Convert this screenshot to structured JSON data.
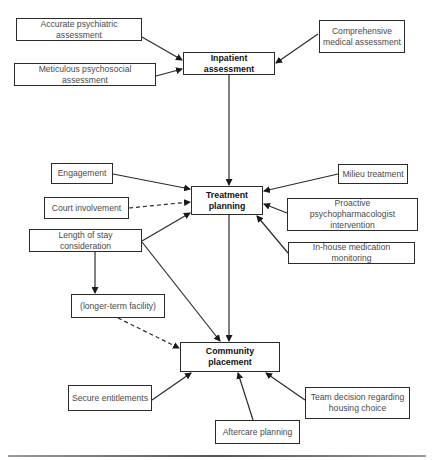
{
  "diagram": {
    "type": "flowchart",
    "nodes": [
      {
        "id": "accurate_psych",
        "label": "Accurate psychiatric assessment",
        "main": false,
        "x": 16,
        "y": 18,
        "w": 126,
        "h": 23
      },
      {
        "id": "meticulous_psychosocial",
        "label": "Meticulous psychosocial assessment",
        "main": false,
        "x": 14,
        "y": 63,
        "w": 142,
        "h": 23
      },
      {
        "id": "comprehensive_medical",
        "label": "Comprehensive medical assessment",
        "main": false,
        "x": 319,
        "y": 20,
        "w": 86,
        "h": 33
      },
      {
        "id": "inpatient",
        "label": "Inpatient assessment",
        "main": true,
        "x": 183,
        "y": 52,
        "w": 92,
        "h": 23
      },
      {
        "id": "engagement",
        "label": "Engagement",
        "main": false,
        "x": 51,
        "y": 163,
        "w": 62,
        "h": 21
      },
      {
        "id": "court",
        "label": "Court involvement",
        "main": false,
        "x": 44,
        "y": 197,
        "w": 85,
        "h": 22
      },
      {
        "id": "length_of_stay",
        "label": "Length of stay consideration",
        "main": false,
        "x": 29,
        "y": 229,
        "w": 113,
        "h": 23
      },
      {
        "id": "treatment",
        "label": "Treatment planning",
        "main": true,
        "x": 191,
        "y": 186,
        "w": 72,
        "h": 29
      },
      {
        "id": "milieu",
        "label": "Milieu treatment",
        "main": false,
        "x": 338,
        "y": 164,
        "w": 70,
        "h": 20
      },
      {
        "id": "proactive",
        "label": "Proactive psychopharmacologist intervention",
        "main": false,
        "x": 287,
        "y": 198,
        "w": 131,
        "h": 33
      },
      {
        "id": "inhouse",
        "label": "In-house medication monitoring",
        "main": false,
        "x": 288,
        "y": 242,
        "w": 127,
        "h": 22
      },
      {
        "id": "longer_term",
        "label": "(longer-term facility)",
        "main": false,
        "x": 71,
        "y": 294,
        "w": 94,
        "h": 24
      },
      {
        "id": "community",
        "label": "Community placement",
        "main": true,
        "x": 180,
        "y": 342,
        "w": 100,
        "h": 30
      },
      {
        "id": "secure",
        "label": "Secure entitlements",
        "main": false,
        "x": 68,
        "y": 385,
        "w": 84,
        "h": 26
      },
      {
        "id": "team",
        "label": "Team decision regarding housing choice",
        "main": false,
        "x": 305,
        "y": 387,
        "w": 105,
        "h": 32
      },
      {
        "id": "aftercare",
        "label": "Aftercare planning",
        "main": false,
        "x": 215,
        "y": 420,
        "w": 85,
        "h": 24
      }
    ],
    "edges": [
      {
        "from": "accurate_psych",
        "to": "inpatient",
        "style": "solid",
        "x1": 142,
        "y1": 37,
        "x2": 182,
        "y2": 60
      },
      {
        "from": "meticulous_psychosocial",
        "to": "inpatient",
        "style": "solid",
        "x1": 156,
        "y1": 76,
        "x2": 182,
        "y2": 69
      },
      {
        "from": "comprehensive_medical",
        "to": "inpatient",
        "style": "solid",
        "x1": 318,
        "y1": 34,
        "x2": 276,
        "y2": 63
      },
      {
        "from": "inpatient",
        "to": "treatment",
        "style": "solid",
        "x1": 229,
        "y1": 75,
        "x2": 229,
        "y2": 185
      },
      {
        "from": "engagement",
        "to": "treatment",
        "style": "solid",
        "x1": 113,
        "y1": 174,
        "x2": 190,
        "y2": 189
      },
      {
        "from": "court",
        "to": "treatment",
        "style": "dashed",
        "x1": 129,
        "y1": 208,
        "x2": 190,
        "y2": 202
      },
      {
        "from": "length_of_stay",
        "to": "treatment",
        "style": "solid",
        "x1": 142,
        "y1": 241,
        "x2": 190,
        "y2": 213
      },
      {
        "from": "milieu",
        "to": "treatment",
        "style": "solid",
        "x1": 338,
        "y1": 174,
        "x2": 264,
        "y2": 191
      },
      {
        "from": "proactive",
        "to": "treatment",
        "style": "solid",
        "x1": 287,
        "y1": 213,
        "x2": 264,
        "y2": 204
      },
      {
        "from": "inhouse",
        "to": "treatment",
        "style": "solid",
        "x1": 288,
        "y1": 253,
        "x2": 257,
        "y2": 216
      },
      {
        "from": "length_of_stay",
        "to": "longer_term",
        "style": "solid",
        "x1": 95,
        "y1": 252,
        "x2": 95,
        "y2": 293
      },
      {
        "from": "length_of_stay",
        "to": "community",
        "style": "solid",
        "x1": 142,
        "y1": 242,
        "x2": 220,
        "y2": 341
      },
      {
        "from": "treatment",
        "to": "community",
        "style": "solid",
        "x1": 229,
        "y1": 215,
        "x2": 229,
        "y2": 341
      },
      {
        "from": "longer_term",
        "to": "community",
        "style": "dashed",
        "x1": 118,
        "y1": 318,
        "x2": 179,
        "y2": 348
      },
      {
        "from": "secure",
        "to": "community",
        "style": "solid",
        "x1": 152,
        "y1": 400,
        "x2": 191,
        "y2": 373
      },
      {
        "from": "aftercare",
        "to": "community",
        "style": "solid",
        "x1": 253,
        "y1": 420,
        "x2": 238,
        "y2": 373
      },
      {
        "from": "team",
        "to": "community",
        "style": "solid",
        "x1": 305,
        "y1": 400,
        "x2": 266,
        "y2": 373
      }
    ]
  },
  "colors": {
    "stroke": "#2b2b2b",
    "text_secondary": "#4a4a4a",
    "text_primary": "#111111",
    "background": "#ffffff"
  }
}
